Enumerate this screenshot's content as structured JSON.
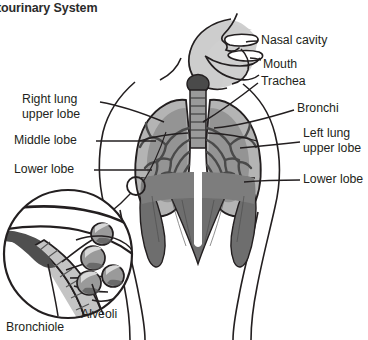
{
  "title": "nitourinary System",
  "diagram": {
    "name": "respiratory-system-diagram",
    "labels": {
      "nasal_cavity": "Nasal cavity",
      "mouth": "Mouth",
      "trachea": "Trachea",
      "bronchi": "Bronchi",
      "left_lung_upper_lobe": "Left lung\nupper lobe",
      "left_lung_upper_lobe_line1": "Left lung",
      "left_lung_upper_lobe_line2": "upper lobe",
      "left_lower_lobe": "Lower lobe",
      "right_lung_upper_lobe_line1": "Right lung",
      "right_lung_upper_lobe_line2": "upper lobe",
      "right_middle_lobe": "Middle lobe",
      "right_lower_lobe": "Lower lobe",
      "alveoli": "Alveoli",
      "bronchiole": "Bronchiole"
    },
    "colors": {
      "outline": "#231f20",
      "lung_fill": "#b4b4b4",
      "lung_inner": "#8e8e8e",
      "bronchial_tree": "#4a4a4a",
      "head_fill": "#cccccc",
      "larynx": "#4a4a4a",
      "trachea_fill": "#9a9a9a",
      "diaphragm": "#6e6e6e",
      "abdomen": "#7d7d7d",
      "alveoli_fill": "#9a9a9a",
      "bronchiole_fill": "#c4c4c4",
      "bronchiole_dark": "#4f4f4f",
      "text": "#231f20",
      "title": "#2b2b2b",
      "background": "#ffffff"
    }
  }
}
